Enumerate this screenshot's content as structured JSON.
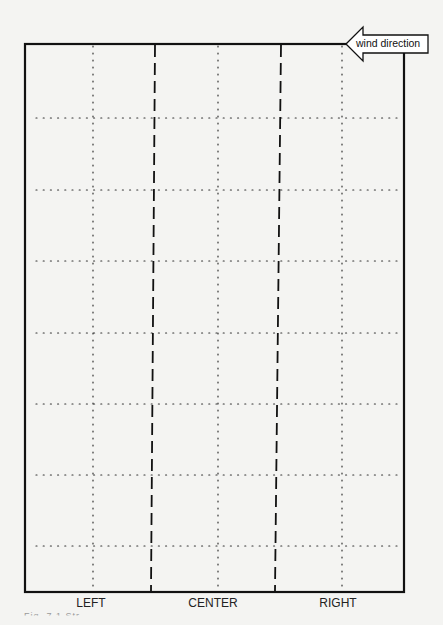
{
  "diagram": {
    "wind_indicator": {
      "label": "wind direction",
      "icon": "left-arrow-icon"
    },
    "lanes": [
      {
        "label": "LEFT",
        "x": 91
      },
      {
        "label": "CENTER",
        "x": 213
      },
      {
        "label": "RIGHT",
        "x": 338
      }
    ],
    "caption": "Fig. 7.1  Str...",
    "grid": {
      "frame": {
        "left": 25,
        "top": 44,
        "right": 404,
        "bottom": 592
      },
      "dotted_vertical_x": [
        93,
        218,
        342
      ],
      "dotted_horizontal_y": [
        118,
        190,
        261,
        333,
        404,
        475,
        546
      ],
      "dashed_lines": [
        {
          "x_top": 155,
          "x_bottom": 151
        },
        {
          "x_top": 281,
          "x_bottom": 275
        }
      ]
    },
    "colors": {
      "background": "#f4f4f2",
      "line": "#111111"
    }
  }
}
